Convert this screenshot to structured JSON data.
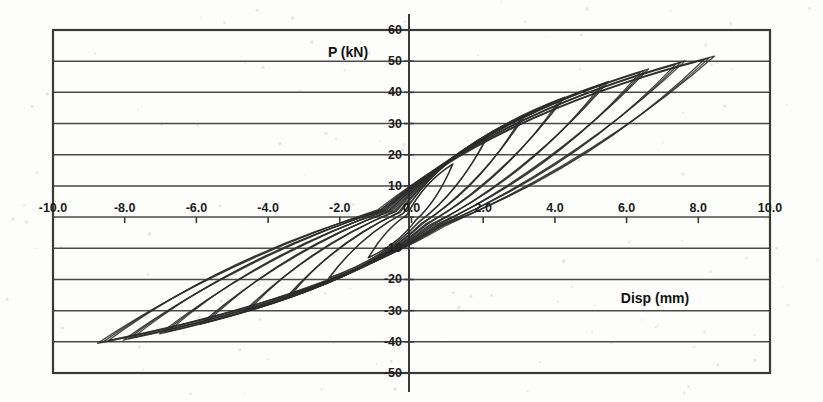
{
  "chart": {
    "title": "",
    "yaxis_title": "P (kN)",
    "xaxis_title": "Disp (mm)"
  },
  "chart_data": {
    "type": "line",
    "title": "",
    "xlabel": "Disp (mm)",
    "ylabel": "P (kN)",
    "xlim": [
      -10.0,
      10.0
    ],
    "ylim": [
      -50,
      60
    ],
    "grid": true,
    "legend": "none",
    "x_ticks": [
      "-10.0",
      "-8.0",
      "-6.0",
      "-4.0",
      "-2.0",
      "0.0",
      "2.0",
      "4.0",
      "6.0",
      "8.0",
      "10.0"
    ],
    "x_tick_values": [
      -10.0,
      -8.0,
      -6.0,
      -4.0,
      -2.0,
      0.0,
      2.0,
      4.0,
      6.0,
      8.0,
      10.0
    ],
    "y_ticks": [
      "60",
      "50",
      "40",
      "30",
      "20",
      "10",
      "0.0",
      "-10",
      "-20",
      "-30",
      "-40",
      "-50"
    ],
    "y_tick_values": [
      60,
      50,
      40,
      30,
      20,
      10,
      0,
      -10,
      -20,
      -30,
      -40,
      -50
    ],
    "series": [
      {
        "name": "cycle-1",
        "peak_disp": 1.15,
        "peak_load": 17.0,
        "min_disp": -1.2,
        "min_load": -13.0
      },
      {
        "name": "cycle-2",
        "peak_disp": 2.1,
        "peak_load": 25.5,
        "min_disp": -2.3,
        "min_load": -19.5
      },
      {
        "name": "cycle-3",
        "peak_disp": 3.1,
        "peak_load": 32.0,
        "min_disp": -3.4,
        "min_load": -25.0
      },
      {
        "name": "cycle-4",
        "peak_disp": 4.2,
        "peak_load": 38.0,
        "min_disp": -4.6,
        "min_load": -30.0
      },
      {
        "name": "cycle-5",
        "peak_disp": 5.4,
        "peak_load": 43.0,
        "min_disp": -5.8,
        "min_load": -34.0
      },
      {
        "name": "cycle-6",
        "peak_disp": 6.5,
        "peak_load": 47.0,
        "min_disp": -6.9,
        "min_load": -37.0
      },
      {
        "name": "cycle-7",
        "peak_disp": 7.5,
        "peak_load": 49.5,
        "min_disp": -7.9,
        "min_load": -39.0
      },
      {
        "name": "cycle-8",
        "peak_disp": 8.3,
        "peak_load": 51.0,
        "min_disp": -8.6,
        "min_load": -40.0
      }
    ]
  },
  "colors": {
    "curve": "#2c2c2c",
    "grid": "#4a4a4a",
    "frame": "#3a3a3a",
    "background": "#fdfdfb"
  }
}
